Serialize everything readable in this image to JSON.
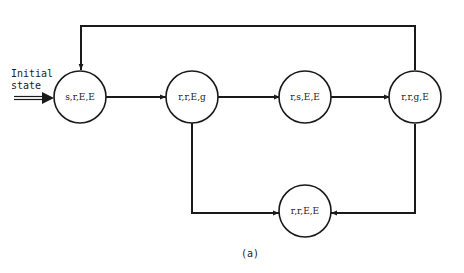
{
  "diagram": {
    "type": "state-transition",
    "initial_label": [
      "Initial",
      "state"
    ],
    "caption": "(a)",
    "states": [
      {
        "id": "s1",
        "label": "s,r,E,E",
        "initial": true
      },
      {
        "id": "s2",
        "label": "r,r,E,g"
      },
      {
        "id": "s3",
        "label": "r,s,E,E"
      },
      {
        "id": "s4",
        "label": "r,r,g,E"
      },
      {
        "id": "s5",
        "label": "r,r,E,E"
      }
    ],
    "transitions": [
      {
        "from": "s1",
        "to": "s2"
      },
      {
        "from": "s2",
        "to": "s3"
      },
      {
        "from": "s3",
        "to": "s4"
      },
      {
        "from": "s4",
        "to": "s1"
      },
      {
        "from": "s2",
        "to": "s5"
      },
      {
        "from": "s4",
        "to": "s5"
      }
    ]
  }
}
